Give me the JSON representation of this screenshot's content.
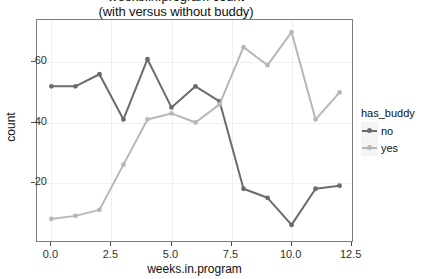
{
  "chart_data": {
    "type": "line",
    "title": "weeks.in.program count",
    "subtitle": "(with versus without buddy)",
    "xlabel": "weeks.in.program",
    "ylabel": "count",
    "xlim": [
      -0.6,
      12.6
    ],
    "ylim": [
      0,
      74
    ],
    "xticks": [
      "0.0",
      "2.5",
      "5.0",
      "7.5",
      "10.0",
      "12.5"
    ],
    "xtick_values": [
      0.0,
      2.5,
      5.0,
      7.5,
      10.0,
      12.5
    ],
    "yticks": [
      "20",
      "40",
      "60"
    ],
    "ytick_values": [
      20,
      40,
      60
    ],
    "grid": true,
    "legend_position": "right",
    "legend_title": "has_buddy",
    "x": [
      0,
      1,
      2,
      3,
      4,
      5,
      6,
      7,
      8,
      9,
      10,
      11,
      12
    ],
    "series": [
      {
        "name": "no",
        "color": "#6b6b6b",
        "values": [
          52,
          52,
          56,
          41,
          61,
          45,
          52,
          47,
          18,
          15,
          6,
          18,
          19
        ]
      },
      {
        "name": "yes",
        "color": "#b7b7b7",
        "values": [
          8,
          9,
          11,
          26,
          41,
          43,
          40,
          46,
          65,
          59,
          70,
          41,
          50
        ]
      }
    ]
  },
  "legend": {
    "title": "has_buddy",
    "entries": [
      {
        "label": "no",
        "color": "#6b6b6b"
      },
      {
        "label": "yes",
        "color": "#b7b7b7"
      }
    ]
  }
}
